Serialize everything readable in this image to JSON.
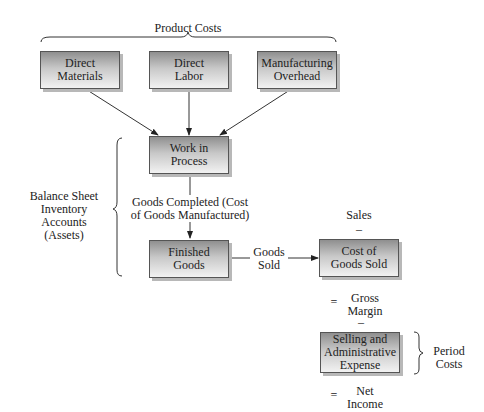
{
  "header": {
    "product_costs": "Product Costs"
  },
  "nodes": {
    "direct_materials": "Direct\nMaterials",
    "direct_labor": "Direct\nLabor",
    "manufacturing_overhead": "Manufacturing\nOverhead",
    "work_in_process": "Work in\nProcess",
    "finished_goods": "Finished\nGoods",
    "cost_of_goods_sold": "Cost of\nGoods Sold",
    "selling_admin_expense": "Selling and\nAdministrative\nExpense"
  },
  "labels": {
    "balance_sheet": "Balance Sheet\nInventory Accounts\n(Assets)",
    "goods_completed": "Goods Completed (Cost\nof Goods Manufactured)",
    "goods_sold": "Goods\nSold",
    "sales": "Sales",
    "minus1": "–",
    "equals1": "=",
    "gross_margin": "Gross\nMargin",
    "minus2": "–",
    "period_costs": "Period\nCosts",
    "equals2": "=",
    "net_income": "Net\nIncome"
  }
}
